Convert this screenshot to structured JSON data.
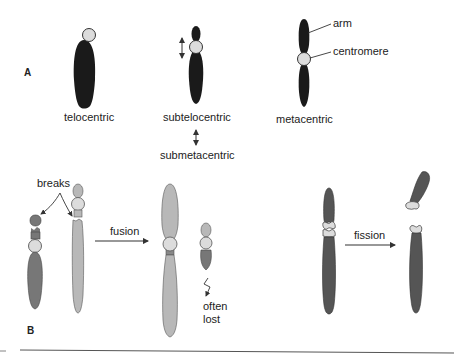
{
  "panels": {
    "a": {
      "label": "A"
    },
    "b": {
      "label": "B"
    }
  },
  "panel_a": {
    "telocentric": "telocentric",
    "subtelocentric": "subtelocentric",
    "submetacentric": "submetacentric",
    "metacentric": "metacentric",
    "arm": "arm",
    "centromere": "centromere"
  },
  "panel_b": {
    "breaks": "breaks",
    "fusion": "fusion",
    "often_lost_1": "often",
    "often_lost_2": "lost",
    "fission": "fission"
  },
  "colors": {
    "dark_chromosome": "#1a1a1a",
    "medium_chromosome": "#777777",
    "light_chromosome": "#b8b8b8",
    "centromere": "#dcdcdc",
    "line": "#444444"
  }
}
